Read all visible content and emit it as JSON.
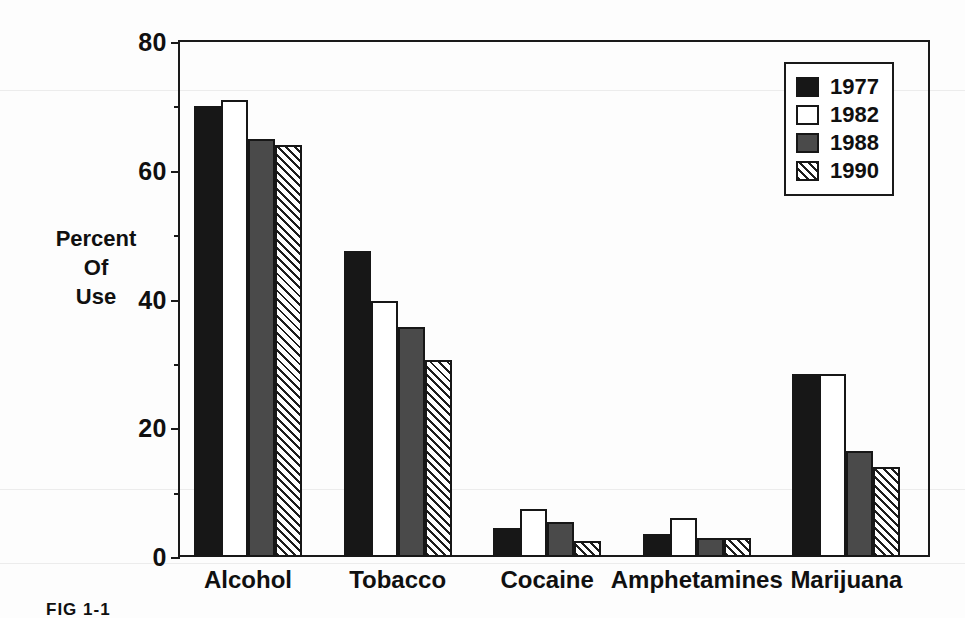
{
  "caption": "FIG 1-1",
  "axis": {
    "y_title_lines": [
      "Percent",
      "Of",
      "Use"
    ],
    "y_major_ticks": [
      "0",
      "20",
      "40",
      "60",
      "80"
    ],
    "y_minor_ticks": [
      10,
      30,
      50,
      70
    ]
  },
  "legend": {
    "entries": [
      {
        "label": "1977",
        "swatch": "solid-black-swatch"
      },
      {
        "label": "1982",
        "swatch": "white-swatch"
      },
      {
        "label": "1988",
        "swatch": "gray-swatch"
      },
      {
        "label": "1990",
        "swatch": "diagonal-hatch-swatch"
      }
    ]
  },
  "chart_data": {
    "type": "bar",
    "title": "",
    "xlabel": "",
    "ylabel": "Percent Of Use",
    "ylim": [
      0,
      80
    ],
    "ytick_step": 20,
    "minor_tick_step": 10,
    "grid": false,
    "legend_position": "top-right",
    "categories": [
      "Alcohol",
      "Tobacco",
      "Cocaine",
      "Amphetamines",
      "Marijuana"
    ],
    "series": [
      {
        "name": "1977",
        "color": "#171717",
        "pattern": "solid",
        "values": [
          70.0,
          47.5,
          4.5,
          3.5,
          28.5
        ]
      },
      {
        "name": "1982",
        "color": "#ffffff",
        "pattern": "empty",
        "values": [
          71.0,
          39.8,
          7.5,
          6.0,
          28.5
        ]
      },
      {
        "name": "1988",
        "color": "#4a4a4a",
        "pattern": "gray",
        "values": [
          65.0,
          35.8,
          5.5,
          3.0,
          16.5
        ]
      },
      {
        "name": "1990",
        "color": "#ffffff",
        "pattern": "hatch",
        "values": [
          64.0,
          30.6,
          2.5,
          3.0,
          14.0
        ]
      }
    ]
  }
}
